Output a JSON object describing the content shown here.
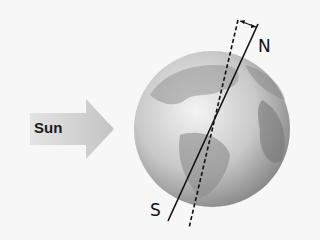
{
  "diagram": {
    "sun_label": "Sun",
    "north_label": "N",
    "south_label": "S",
    "elements": [
      "sun-arrow",
      "earth-globe",
      "rotation-axis",
      "perpendicular-dashed-line",
      "tilt-angle-arrow"
    ],
    "colors": {
      "arrow": "#cfcfcf",
      "globe_light": "#e6e6e6",
      "globe_dark": "#777777",
      "line": "#111111"
    }
  }
}
